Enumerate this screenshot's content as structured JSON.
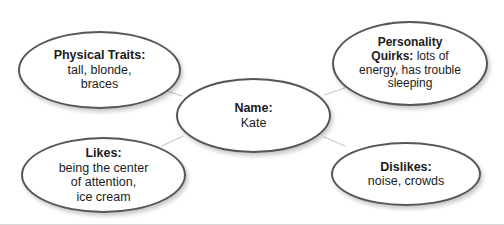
{
  "diagram": {
    "type": "concept-web",
    "background_color": "#ffffff",
    "oval_stroke_color": "#565656",
    "connector_color": "#c9c9c9",
    "text_color": "#1b1b1b",
    "center": {
      "id": "name",
      "label": "Name:",
      "body": "Kate"
    },
    "branches": [
      {
        "id": "physical-traits",
        "label": "Physical Traits:",
        "body": "tall, blonde, braces",
        "lines": [
          "tall, blonde,",
          "braces"
        ]
      },
      {
        "id": "personality-quirks",
        "label": "Personality Quirks:",
        "label_lines": [
          "Personality",
          "Quirks:"
        ],
        "body": "lots of energy, has trouble sleeping",
        "lines": [
          "lots of",
          "energy, has trouble",
          "sleeping"
        ]
      },
      {
        "id": "likes",
        "label": "Likes:",
        "body": "being the center of attention, ice cream",
        "lines": [
          "being the center",
          "of attention,",
          "ice cream"
        ]
      },
      {
        "id": "dislikes",
        "label": "Dislikes:",
        "body": "noise, crowds",
        "lines": [
          "noise, crowds"
        ]
      }
    ]
  }
}
